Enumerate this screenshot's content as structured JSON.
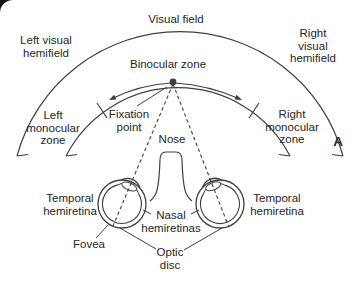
{
  "figure": {
    "panel_label": "A",
    "labels": {
      "visual_field": "Visual field",
      "left_hemifield": "Left visual\nhemifield",
      "right_hemifield": "Right visual\nhemifield",
      "binocular_zone": "Binocular zone",
      "fixation_point": "Fixation\npoint",
      "left_monocular": "Left\nmonocular\nzone",
      "right_monocular": "Right\nmonocular\nzone",
      "nose": "Nose",
      "temporal_left": "Temporal\nhemiretina",
      "temporal_right": "Temporal\nhemiretina",
      "nasal_hemiretinas": "Nasal\nhemiretinas",
      "fovea": "Fovea",
      "optic_disc": "Optic\ndisc"
    },
    "colors": {
      "line": "#3f3f3f",
      "text": "#262626",
      "background": "#ffffff",
      "corner": "#151515"
    }
  }
}
